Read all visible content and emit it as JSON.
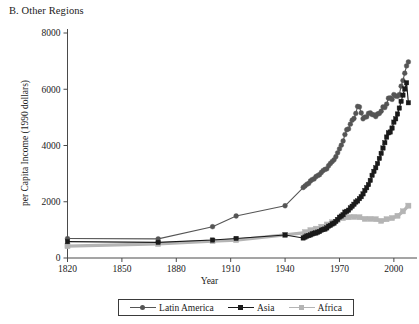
{
  "figure": {
    "panel_title": "B. Other Regions",
    "background_color": "#ffffff"
  },
  "chart_data": {
    "type": "line",
    "title": "B. Other Regions",
    "xlabel": "Year",
    "ylabel": "per Capita Income (1990 dollars)",
    "xlim": [
      1820,
      2010
    ],
    "ylim": [
      0,
      8000
    ],
    "xticks": [
      1820,
      1850,
      1880,
      1910,
      1940,
      1970,
      2000
    ],
    "yticks": [
      0,
      2000,
      4000,
      6000,
      8000
    ],
    "grid": false,
    "legend_position": "bottom",
    "series": [
      {
        "name": "Latin America",
        "color": "#555555",
        "marker": "circle",
        "x": [
          1820,
          1870,
          1900,
          1913,
          1940,
          1950,
          1951,
          1952,
          1953,
          1954,
          1955,
          1956,
          1957,
          1958,
          1959,
          1960,
          1961,
          1962,
          1963,
          1964,
          1965,
          1966,
          1967,
          1968,
          1969,
          1970,
          1971,
          1972,
          1973,
          1974,
          1975,
          1976,
          1977,
          1978,
          1979,
          1980,
          1981,
          1982,
          1983,
          1984,
          1985,
          1986,
          1987,
          1988,
          1989,
          1990,
          1991,
          1992,
          1993,
          1994,
          1995,
          1996,
          1997,
          1998,
          1999,
          2000,
          2001,
          2002,
          2003,
          2004,
          2005,
          2006,
          2007,
          2008
        ],
        "y": [
          692,
          681,
          1113,
          1494,
          1857,
          2506,
          2560,
          2620,
          2650,
          2740,
          2790,
          2810,
          2890,
          2930,
          2960,
          3040,
          3110,
          3150,
          3170,
          3280,
          3360,
          3430,
          3490,
          3600,
          3740,
          3880,
          4010,
          4160,
          4390,
          4560,
          4590,
          4760,
          4900,
          4960,
          5140,
          5390,
          5370,
          5160,
          4950,
          5010,
          5020,
          5140,
          5160,
          5100,
          5090,
          5030,
          5120,
          5140,
          5220,
          5370,
          5350,
          5470,
          5680,
          5690,
          5640,
          5810,
          5760,
          5750,
          5810,
          6110,
          6310,
          6570,
          6830,
          6970
        ]
      },
      {
        "name": "Asia",
        "color": "#1a1a1a",
        "marker": "square",
        "x": [
          1820,
          1870,
          1900,
          1913,
          1940,
          1950,
          1951,
          1952,
          1953,
          1954,
          1955,
          1956,
          1957,
          1958,
          1959,
          1960,
          1961,
          1962,
          1963,
          1964,
          1965,
          1966,
          1967,
          1968,
          1969,
          1970,
          1971,
          1972,
          1973,
          1974,
          1975,
          1976,
          1977,
          1978,
          1979,
          1980,
          1981,
          1982,
          1983,
          1984,
          1985,
          1986,
          1987,
          1988,
          1989,
          1990,
          1991,
          1992,
          1993,
          1994,
          1995,
          1996,
          1997,
          1998,
          1999,
          2000,
          2001,
          2002,
          2003,
          2004,
          2005,
          2006,
          2007,
          2008
        ],
        "y": [
          581,
          556,
          638,
          696,
          820,
          712,
          745,
          780,
          800,
          820,
          855,
          880,
          890,
          920,
          940,
          990,
          1010,
          1030,
          1070,
          1130,
          1160,
          1210,
          1240,
          1300,
          1370,
          1450,
          1490,
          1540,
          1630,
          1660,
          1700,
          1780,
          1840,
          1910,
          1990,
          2030,
          2110,
          2180,
          2280,
          2400,
          2500,
          2610,
          2760,
          2940,
          3080,
          3210,
          3360,
          3540,
          3720,
          3910,
          4100,
          4300,
          4450,
          4480,
          4620,
          4830,
          4950,
          5120,
          5330,
          5570,
          5790,
          6010,
          6230,
          5520
        ]
      },
      {
        "name": "Africa",
        "color": "#b4b4b4",
        "marker": "square",
        "x": [
          1820,
          1870,
          1900,
          1913,
          1940,
          1950,
          1951,
          1952,
          1953,
          1954,
          1955,
          1956,
          1957,
          1958,
          1959,
          1960,
          1961,
          1962,
          1963,
          1964,
          1965,
          1966,
          1967,
          1968,
          1969,
          1970,
          1971,
          1972,
          1973,
          1974,
          1975,
          1976,
          1977,
          1978,
          1979,
          1980,
          1981,
          1982,
          1983,
          1984,
          1985,
          1986,
          1987,
          1988,
          1989,
          1990,
          1991,
          1992,
          1993,
          1994,
          1995,
          1996,
          1997,
          1998,
          1999,
          2000,
          2001,
          2002,
          2003,
          2004,
          2005,
          2006,
          2007,
          2008
        ],
        "y": [
          420,
          500,
          601,
          637,
          820,
          894,
          920,
          940,
          960,
          990,
          1010,
          1030,
          1040,
          1060,
          1080,
          1110,
          1130,
          1150,
          1190,
          1230,
          1250,
          1270,
          1280,
          1300,
          1350,
          1380,
          1400,
          1420,
          1450,
          1460,
          1450,
          1470,
          1480,
          1460,
          1470,
          1470,
          1450,
          1430,
          1390,
          1390,
          1410,
          1400,
          1390,
          1400,
          1390,
          1380,
          1360,
          1330,
          1320,
          1330,
          1350,
          1380,
          1400,
          1400,
          1420,
          1450,
          1470,
          1500,
          1540,
          1600,
          1660,
          1720,
          1790,
          1860
        ]
      }
    ]
  },
  "legend": {
    "entries": [
      {
        "label": "Latin America",
        "color": "#555555",
        "marker": "circle"
      },
      {
        "label": "Asia",
        "color": "#1a1a1a",
        "marker": "square"
      },
      {
        "label": "Africa",
        "color": "#b4b4b4",
        "marker": "square"
      }
    ]
  }
}
